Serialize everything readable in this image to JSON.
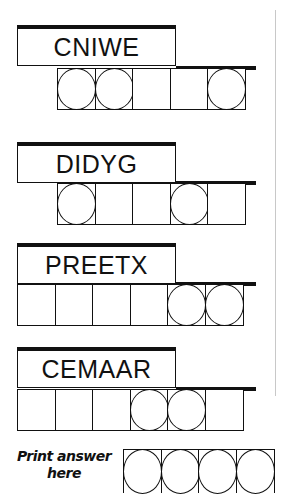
{
  "puzzles": [
    {
      "scrambled": "CNIWE",
      "cells": [
        false,
        true,
        true,
        false,
        false,
        true
      ],
      "offset": 1
    },
    {
      "scrambled": "DIDYG",
      "cells": [
        false,
        true,
        false,
        false,
        true,
        false
      ],
      "offset": 1
    },
    {
      "scrambled": "PREETX",
      "cells": [
        false,
        false,
        false,
        false,
        true,
        true
      ],
      "offset": 0
    },
    {
      "scrambled": "CEMAAR",
      "cells": [
        false,
        false,
        false,
        true,
        true,
        false
      ],
      "offset": 0
    }
  ],
  "answer": {
    "label_line1": "Print answer",
    "label_line2": "here",
    "circle_count": 4
  }
}
